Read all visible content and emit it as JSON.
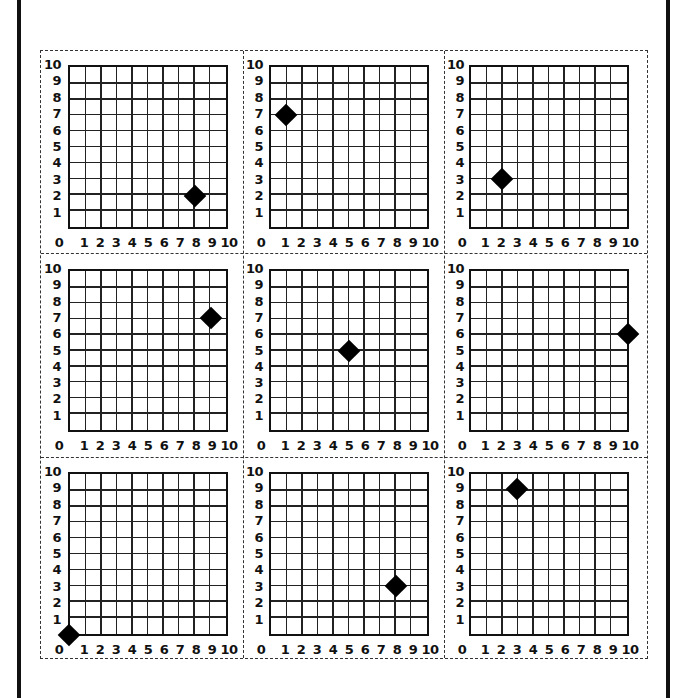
{
  "chart_data": [
    {
      "type": "scatter",
      "panel": 1,
      "row": 1,
      "col": 1,
      "x": [
        8
      ],
      "y": [
        2
      ],
      "xlim": [
        0,
        10
      ],
      "ylim": [
        0,
        10
      ],
      "xticks": [
        "0",
        "1",
        "2",
        "3",
        "4",
        "5",
        "6",
        "7",
        "8",
        "9",
        "10"
      ],
      "yticks": [
        "1",
        "2",
        "3",
        "4",
        "5",
        "6",
        "7",
        "8",
        "9",
        "10"
      ],
      "grid": true,
      "marker": "diamond"
    },
    {
      "type": "scatter",
      "panel": 2,
      "row": 1,
      "col": 2,
      "x": [
        1
      ],
      "y": [
        7
      ],
      "xlim": [
        0,
        10
      ],
      "ylim": [
        0,
        10
      ],
      "xticks": [
        "0",
        "1",
        "2",
        "3",
        "4",
        "5",
        "6",
        "7",
        "8",
        "9",
        "10"
      ],
      "yticks": [
        "1",
        "2",
        "3",
        "4",
        "5",
        "6",
        "7",
        "8",
        "9",
        "10"
      ],
      "grid": true,
      "marker": "diamond"
    },
    {
      "type": "scatter",
      "panel": 3,
      "row": 1,
      "col": 3,
      "x": [
        2
      ],
      "y": [
        3
      ],
      "xlim": [
        0,
        10
      ],
      "ylim": [
        0,
        10
      ],
      "xticks": [
        "0",
        "1",
        "2",
        "3",
        "4",
        "5",
        "6",
        "7",
        "8",
        "9",
        "10"
      ],
      "yticks": [
        "1",
        "2",
        "3",
        "4",
        "5",
        "6",
        "7",
        "8",
        "9",
        "10"
      ],
      "grid": true,
      "marker": "diamond"
    },
    {
      "type": "scatter",
      "panel": 4,
      "row": 2,
      "col": 1,
      "x": [
        9
      ],
      "y": [
        7
      ],
      "xlim": [
        0,
        10
      ],
      "ylim": [
        0,
        10
      ],
      "xticks": [
        "0",
        "1",
        "2",
        "3",
        "4",
        "5",
        "6",
        "7",
        "8",
        "9",
        "10"
      ],
      "yticks": [
        "1",
        "2",
        "3",
        "4",
        "5",
        "6",
        "7",
        "8",
        "9",
        "10"
      ],
      "grid": true,
      "marker": "diamond"
    },
    {
      "type": "scatter",
      "panel": 5,
      "row": 2,
      "col": 2,
      "x": [
        5
      ],
      "y": [
        5
      ],
      "xlim": [
        0,
        10
      ],
      "ylim": [
        0,
        10
      ],
      "xticks": [
        "0",
        "1",
        "2",
        "3",
        "4",
        "5",
        "6",
        "7",
        "8",
        "9",
        "10"
      ],
      "yticks": [
        "1",
        "2",
        "3",
        "4",
        "5",
        "6",
        "7",
        "8",
        "9",
        "10"
      ],
      "grid": true,
      "marker": "diamond"
    },
    {
      "type": "scatter",
      "panel": 6,
      "row": 2,
      "col": 3,
      "x": [
        10
      ],
      "y": [
        6
      ],
      "xlim": [
        0,
        10
      ],
      "ylim": [
        0,
        10
      ],
      "xticks": [
        "0",
        "1",
        "2",
        "3",
        "4",
        "5",
        "6",
        "7",
        "8",
        "9",
        "10"
      ],
      "yticks": [
        "1",
        "2",
        "3",
        "4",
        "5",
        "6",
        "7",
        "8",
        "9",
        "10"
      ],
      "grid": true,
      "marker": "diamond"
    },
    {
      "type": "scatter",
      "panel": 7,
      "row": 3,
      "col": 1,
      "x": [
        0
      ],
      "y": [
        0
      ],
      "xlim": [
        0,
        10
      ],
      "ylim": [
        0,
        10
      ],
      "xticks": [
        "0",
        "1",
        "2",
        "3",
        "4",
        "5",
        "6",
        "7",
        "8",
        "9",
        "10"
      ],
      "yticks": [
        "1",
        "2",
        "3",
        "4",
        "5",
        "6",
        "7",
        "8",
        "9",
        "10"
      ],
      "grid": true,
      "marker": "diamond"
    },
    {
      "type": "scatter",
      "panel": 8,
      "row": 3,
      "col": 2,
      "x": [
        8
      ],
      "y": [
        3
      ],
      "xlim": [
        0,
        10
      ],
      "ylim": [
        0,
        10
      ],
      "xticks": [
        "0",
        "1",
        "2",
        "3",
        "4",
        "5",
        "6",
        "7",
        "8",
        "9",
        "10"
      ],
      "yticks": [
        "1",
        "2",
        "3",
        "4",
        "5",
        "6",
        "7",
        "8",
        "9",
        "10"
      ],
      "grid": true,
      "marker": "diamond"
    },
    {
      "type": "scatter",
      "panel": 9,
      "row": 3,
      "col": 3,
      "x": [
        3
      ],
      "y": [
        9
      ],
      "xlim": [
        0,
        10
      ],
      "ylim": [
        0,
        10
      ],
      "xticks": [
        "0",
        "1",
        "2",
        "3",
        "4",
        "5",
        "6",
        "7",
        "8",
        "9",
        "10"
      ],
      "yticks": [
        "1",
        "2",
        "3",
        "4",
        "5",
        "6",
        "7",
        "8",
        "9",
        "10"
      ],
      "grid": true,
      "marker": "diamond"
    }
  ],
  "colors": {
    "ink": "#111111",
    "background": "#ffffff"
  },
  "layout": {
    "rows": 3,
    "cols": 3,
    "cut_lines": "dashed"
  }
}
